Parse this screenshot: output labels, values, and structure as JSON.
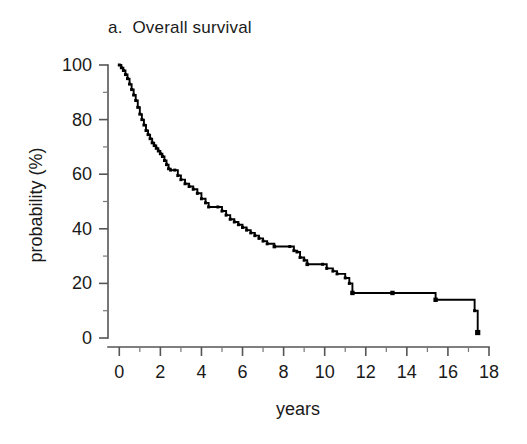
{
  "chart_data": {
    "type": "line",
    "title": "a.  Overall survival",
    "panel_letter": "a.",
    "panel_name": "Overall survival",
    "xlabel": "years",
    "ylabel": "probability (%)",
    "xlim": [
      -0.55,
      18
    ],
    "ylim": [
      0,
      100
    ],
    "grid": false,
    "legend": null,
    "x_ticks_major": [
      0,
      2,
      4,
      6,
      8,
      10,
      12,
      14,
      16,
      18
    ],
    "x_tick_labels": [
      "0",
      "2",
      "4",
      "6",
      "8",
      "10",
      "12",
      "14",
      "16",
      "18"
    ],
    "x_ticks_minor": [
      1,
      3,
      5,
      7,
      9,
      11,
      13,
      15,
      17
    ],
    "y_ticks_major": [
      0,
      20,
      40,
      60,
      80,
      100
    ],
    "y_tick_labels": [
      "0",
      "20",
      "40",
      "60",
      "80",
      "100"
    ],
    "y_ticks_minor": [
      10,
      30,
      50,
      70,
      90
    ],
    "curve_style": "kaplan-meier step function",
    "line_color": "#000000",
    "series": [
      {
        "name": "Overall survival",
        "x": [
          0.0,
          0.1,
          0.2,
          0.3,
          0.4,
          0.5,
          0.6,
          0.7,
          0.8,
          0.9,
          1.0,
          1.1,
          1.2,
          1.3,
          1.4,
          1.5,
          1.6,
          1.7,
          1.8,
          1.9,
          2.0,
          2.1,
          2.2,
          2.3,
          2.4,
          2.5,
          2.7,
          2.85,
          3.0,
          3.2,
          3.4,
          3.6,
          3.8,
          4.0,
          4.2,
          4.35,
          4.8,
          5.0,
          5.2,
          5.4,
          5.6,
          5.8,
          6.0,
          6.2,
          6.4,
          6.6,
          6.8,
          7.0,
          7.2,
          7.55,
          8.3,
          8.5,
          8.65,
          8.8,
          9.0,
          9.15,
          9.9,
          10.1,
          10.4,
          10.6,
          11.0,
          11.2,
          11.35,
          13.3,
          15.4,
          17.3,
          17.45
        ],
        "values": [
          100,
          99,
          98,
          96.5,
          95,
          93,
          91,
          89,
          87,
          84.5,
          82,
          80,
          78,
          76,
          74.5,
          73,
          71.5,
          70.5,
          69.5,
          68.5,
          67.5,
          66.5,
          65,
          63.5,
          62,
          61.5,
          61.5,
          59.5,
          58,
          56.5,
          55.5,
          54.5,
          53,
          51,
          49.5,
          48,
          48,
          46.5,
          45,
          43.5,
          42.5,
          41.5,
          40.5,
          39.5,
          38.5,
          37.5,
          36.5,
          35.5,
          34.5,
          33.5,
          33.5,
          32,
          31.5,
          29.5,
          28.5,
          27,
          27,
          25.5,
          24.5,
          23.5,
          22,
          20,
          16.5,
          16.5,
          14,
          10,
          2
        ],
        "y_start": 100,
        "y_end": 2
      }
    ],
    "censor_marks_visible": true
  },
  "axes": {
    "y_axis_title": "probability (%)",
    "x_axis_title": "years"
  }
}
